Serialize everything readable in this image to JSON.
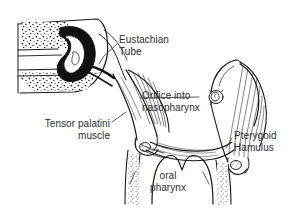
{
  "figure": {
    "background_color": "#ffffff",
    "ink_color": "#1a1a1a",
    "text_color": "#2e2e2e",
    "width": 292,
    "height": 209
  },
  "labels": {
    "eustachian_tube": "Eustachian\nTube",
    "orifice": "Orifice into\nnasopharynx",
    "tensor_palatini": "Tensor palatini\nmuscle",
    "pterygoid_hamulus": "Pterygoid\nHamulus",
    "oral_pharynx": "oral\npharynx"
  },
  "structures": [
    {
      "name": "middle-ear-cross-section",
      "description": "stippled temporal bone with black-filled tympanic cavity",
      "side": "left"
    },
    {
      "name": "eustachian-tube-left",
      "description": "cartilaginous tube descending medially from middle ear",
      "side": "left"
    },
    {
      "name": "eustachian-tube-right",
      "description": "cartilaginous tube descending medially, mirrored",
      "side": "right"
    },
    {
      "name": "tube-orifice",
      "description": "coiled torus tubarius opening into nasopharynx",
      "side": "right"
    },
    {
      "name": "tensor-veli-palatini-left",
      "description": "striated muscle fan",
      "side": "left"
    },
    {
      "name": "tensor-veli-palatini-right",
      "description": "striated muscle fan",
      "side": "right"
    },
    {
      "name": "pterygoid-hamulus-left",
      "description": "bony hook at muscle tendon turn",
      "side": "left"
    },
    {
      "name": "pterygoid-hamulus-right",
      "description": "bony hook at muscle tendon turn",
      "side": "right"
    },
    {
      "name": "soft-palate",
      "description": "velum spanning midline with uvula notch",
      "side": "center"
    },
    {
      "name": "oral-pharynx-cavity",
      "description": "arched airway opening below soft palate",
      "side": "center"
    }
  ],
  "leader_lines": [
    {
      "name": "leader-eustachian",
      "from": "eustachian_tube label",
      "to": "eustachian-tube-left"
    },
    {
      "name": "leader-orifice",
      "from": "orifice label",
      "to": "tube-orifice"
    },
    {
      "name": "leader-tensor",
      "from": "tensor_palatini label",
      "to": "tensor-veli-palatini-left"
    },
    {
      "name": "leader-pterygoid",
      "from": "pterygoid_hamulus label",
      "to": "pterygoid-hamulus-right"
    },
    {
      "name": "leader-oral-left",
      "from": "oral_pharynx label",
      "to": "pharyngeal-wall-left"
    },
    {
      "name": "leader-oral-right",
      "from": "oral_pharynx label",
      "to": "pharyngeal-wall-right"
    }
  ]
}
